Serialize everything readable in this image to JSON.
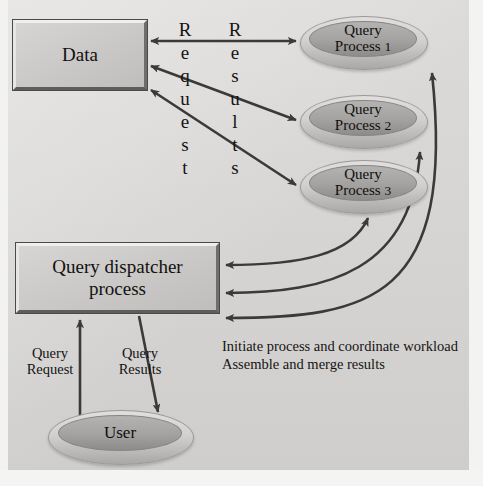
{
  "diagram": {
    "colors": {
      "background": "#d9d9d7",
      "frame": "#f3f3f2",
      "box_fill": "#c9c8c6",
      "ellipse_fill": "#a3a2a0",
      "ellipse_ring": "#d2d1cf",
      "arrow": "#3b3a38",
      "text": "#13110f"
    },
    "nodes": {
      "data_box": {
        "label": "Data"
      },
      "dispatcher_box": {
        "line1": "Query dispatcher",
        "line2": "process"
      },
      "user_ellipse": {
        "label": "User"
      },
      "query_processes": [
        {
          "line1": "Query",
          "line2": "Process",
          "num": "1"
        },
        {
          "line1": "Query",
          "line2": "Process",
          "num": "2"
        },
        {
          "line1": "Query",
          "line2": "Process",
          "num": "3"
        }
      ]
    },
    "edge_labels": {
      "request_vertical": [
        "R",
        "e",
        "q",
        "u",
        "e",
        "s",
        "t"
      ],
      "results_vertical": [
        "R",
        "e",
        "s",
        "u",
        "l",
        "t",
        "s"
      ],
      "query_request": {
        "line1": "Query",
        "line2": "Request"
      },
      "query_results": {
        "line1": "Query",
        "line2": "Results"
      }
    },
    "notes": {
      "line1": "Initiate process and coordinate workload",
      "line2": "Assemble and merge results"
    }
  }
}
